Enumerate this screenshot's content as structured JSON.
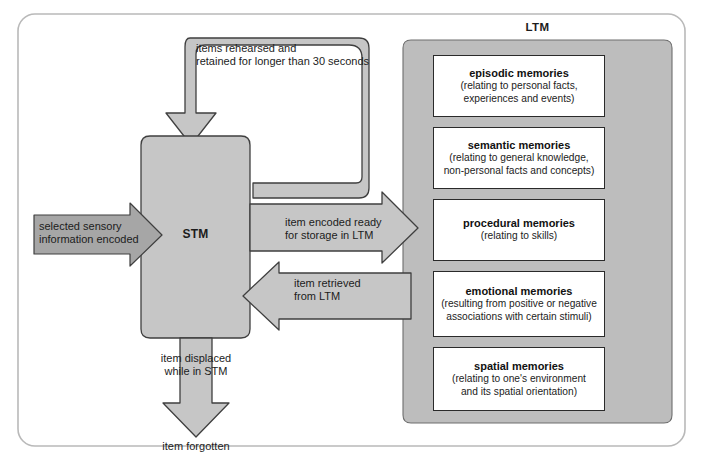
{
  "figure": {
    "title_ltm": "LTM",
    "title_stm": "STM"
  },
  "flow_labels": {
    "rehearsal": "items rehearsed and\nretained for longer than 30 seconds",
    "sensory_input": "selected sensory\ninformation encoded",
    "encoded_to_ltm": "item encoded ready\nfor storage in LTM",
    "retrieved_from_ltm": "item retrieved\nfrom LTM",
    "displaced": "item displaced\nwhile in STM",
    "forgotten": "item forgotten"
  },
  "ltm_memories": [
    {
      "title": "episodic memories",
      "desc": "(relating to personal facts,\nexperiences and events)"
    },
    {
      "title": "semantic memories",
      "desc": "(relating to general knowledge,\nnon-personal facts and concepts)"
    },
    {
      "title": "procedural memories",
      "desc": "(relating to skills)"
    },
    {
      "title": "emotional memories",
      "desc": "(resulting from positive or negative\nassociations with certain stimuli)"
    },
    {
      "title": "spatial memories",
      "desc": "(relating to one's environment\nand its spatial orientation)"
    }
  ],
  "colors": {
    "frame_border": "#b9b9b9",
    "shape_fill": "#c6c6c6",
    "shape_stroke": "#4a4a4a",
    "ltm_panel_fill": "#bdbdbd",
    "input_arrow_fill": "#a6a6a6",
    "box_fill": "#ffffff",
    "text": "#1c1c1c",
    "background": "#ffffff"
  }
}
